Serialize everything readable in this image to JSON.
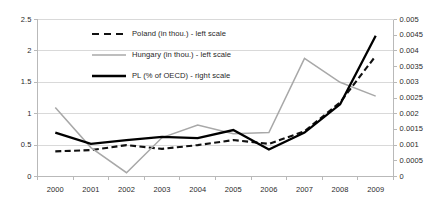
{
  "chart_data": {
    "type": "line",
    "title": "",
    "xlabel": "",
    "ylabel": "",
    "grid": true,
    "legend_position": "inside-top-center",
    "categories": [
      "2000",
      "2001",
      "2002",
      "2003",
      "2004",
      "2005",
      "2006",
      "2007",
      "2008",
      "2009"
    ],
    "axes": {
      "left": {
        "label": "in thou.",
        "ylim": [
          0,
          2.5
        ],
        "ticks": [
          "0",
          "0.5",
          "1",
          "1.5",
          "2",
          "2.5"
        ],
        "tick_values": [
          0,
          0.5,
          1,
          1.5,
          2,
          2.5
        ]
      },
      "right": {
        "label": "% of OECD",
        "ylim": [
          0,
          0.005
        ],
        "ticks": [
          "0",
          "0.0005",
          "0.001",
          "0.0015",
          "0.002",
          "0.0025",
          "0.003",
          "0.0035",
          "0.004",
          "0.0045",
          "0.005"
        ],
        "tick_values": [
          0,
          0.0005,
          0.001,
          0.0015,
          0.002,
          0.0025,
          0.003,
          0.0035,
          0.004,
          0.0045,
          0.005
        ]
      }
    },
    "series": [
      {
        "name": "Poland (in thou.) - left scale",
        "axis": "left",
        "style": "dashed",
        "color": "#111111",
        "values": [
          0.4,
          0.42,
          0.5,
          0.44,
          0.5,
          0.58,
          0.52,
          0.72,
          1.18,
          1.92
        ]
      },
      {
        "name": "Hungary (in thou.) - left scale",
        "axis": "left",
        "style": "solid",
        "color": "#a8a8a8",
        "values": [
          1.1,
          0.46,
          0.06,
          0.62,
          0.82,
          0.68,
          0.7,
          1.88,
          1.5,
          1.28
        ]
      },
      {
        "name": "PL (% of OECD) - right scale",
        "axis": "right",
        "style": "solid-thick",
        "color": "#000000",
        "values": [
          0.0014,
          0.00104,
          0.00116,
          0.00126,
          0.00122,
          0.00148,
          0.00086,
          0.0014,
          0.0023,
          0.00448
        ]
      }
    ],
    "legend": [
      {
        "label": "Poland (in thou.) - left scale",
        "style": "dashed",
        "color": "#111111"
      },
      {
        "label": "Hungary (in thou.) - left scale",
        "style": "solid",
        "color": "#a8a8a8"
      },
      {
        "label": "PL (% of OECD) - right scale",
        "style": "solid-thick",
        "color": "#000000"
      }
    ],
    "colors": {
      "frame": "#b9b9b9",
      "grid": "#d9d9d9",
      "poland": "#111111",
      "hungary": "#a8a8a8",
      "pl_oecd": "#000000"
    }
  }
}
